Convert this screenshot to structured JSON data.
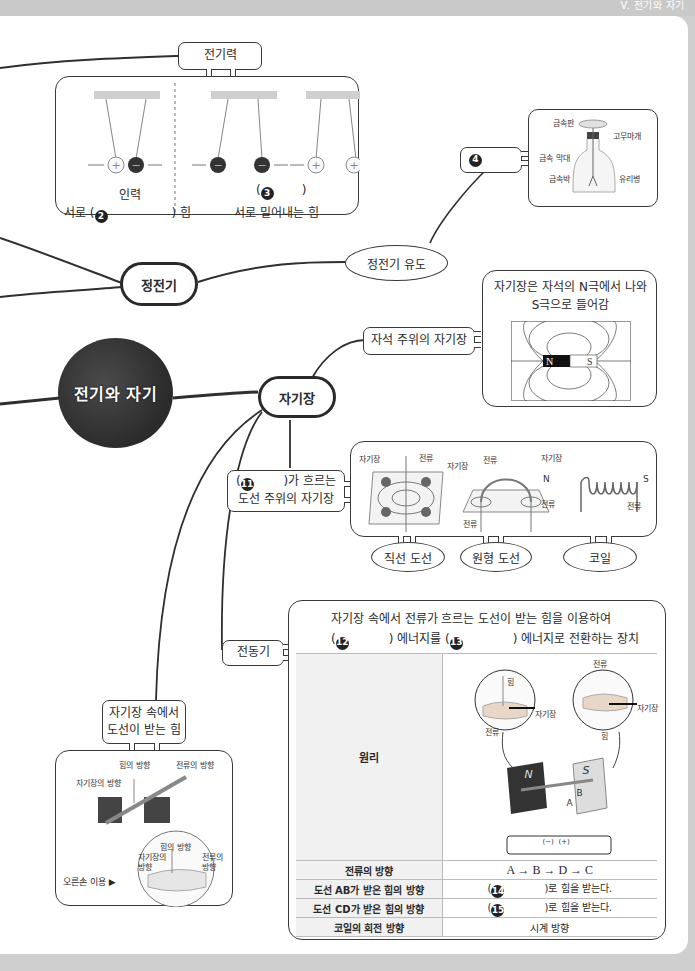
{
  "header": {
    "section_label": "V. 전기와 자기"
  },
  "center_node": {
    "label": "전기와 자기"
  },
  "static_electricity": {
    "label": "정전기",
    "electric_force": {
      "label": "전기력",
      "attraction": {
        "name": "인력",
        "desc_prefix": "서로 (",
        "blank_num": "❷",
        "desc_suffix": ") 힘"
      },
      "repulsion": {
        "blank_num": "❸",
        "paren_open": "(",
        "paren_close": ")",
        "desc": "서로 밀어내는 힘"
      },
      "charges": [
        "+",
        "−",
        "−",
        "−",
        "+",
        "+"
      ]
    },
    "induction": {
      "label": "정전기 유도",
      "blank_num": "❹",
      "electroscope_labels": [
        "금속판",
        "고무마개",
        "금속 막대",
        "금속박",
        "유리병"
      ]
    }
  },
  "magnetic_field": {
    "label": "자기장",
    "around_magnet": {
      "label": "자석 주위의 자기장",
      "desc": "자기장은 자석의 N극에서 나와 S극으로 들어감",
      "desc_line1": "자기장은 자석의 N극에서 나와",
      "desc_line2": "S극으로 들어감",
      "poles": [
        "N",
        "S"
      ]
    },
    "around_wire": {
      "label_blank_num": "⓫",
      "label_line1_suffix": ")가 흐르는",
      "label_line2": "도선 주위의 자기장",
      "fig_labels": {
        "straight": [
          "자기장",
          "전류"
        ],
        "circular": [
          "자기장",
          "전류",
          "전류"
        ],
        "coil": [
          "자기장",
          "N",
          "S",
          "전류",
          "전류"
        ]
      },
      "types": [
        "직선 도선",
        "원형 도선",
        "코일"
      ]
    },
    "force_on_wire": {
      "label_line1": "자기장 속에서",
      "label_line2": "도선이 받는 힘",
      "fig_labels": [
        "힘의 방향",
        "전류의 방향",
        "자기장의 방향",
        "힘의 방향",
        "자기장의 방향",
        "전류의 방향"
      ],
      "right_hand": "오른손 이용 ▶"
    },
    "motor": {
      "label": "전동기",
      "desc_line1": "자기장 속에서 전류가 흐르는 도선이 받는 힘을 이용하여",
      "desc_line2_parts": [
        "(",
        "❿",
        ") 에너지를 (",
        "⓭",
        ") 에너지로 전환하는 장치"
      ],
      "blank12": "⓬",
      "blank13": "⓭",
      "fig_labels": [
        "전류",
        "힘",
        "자기장",
        "전류",
        "자기장",
        "힘",
        "N",
        "S",
        "A",
        "B",
        "C",
        "D",
        "(−)",
        "(+)"
      ],
      "table": [
        {
          "key": "원리",
          "value": ""
        },
        {
          "key": "전류의 방향",
          "value": "A → B → D → C"
        },
        {
          "key": "도선 AB가 받은 힘의 방향",
          "blank": "⓮",
          "value": ")로 힘을 받는다."
        },
        {
          "key": "도선 CD가 받은 힘의 방향",
          "blank": "⓯",
          "value": ")로 힘을 받는다."
        },
        {
          "key": "코일의 회전 방향",
          "value": "시계 방향"
        }
      ]
    }
  }
}
